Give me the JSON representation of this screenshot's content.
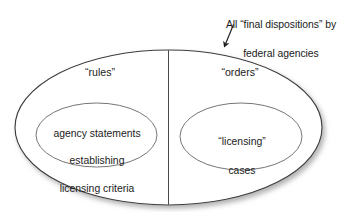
{
  "diagram": {
    "type": "euler-venn",
    "title_callout": {
      "line1": "All “final dispositions” by",
      "line2": "federal agencies",
      "points_to": "outer-ellipse"
    },
    "outer_region": {
      "name": "all-final-dispositions",
      "divided_into": 2
    },
    "left_half": {
      "label": "“rules”",
      "inner": {
        "line1": "agency statements",
        "line2": "establishing",
        "line3": "licensing criteria"
      }
    },
    "right_half": {
      "label": "“orders”",
      "inner": {
        "line1": "“licensing”",
        "line2": "cases"
      }
    },
    "colors": {
      "background": "#ffffff",
      "stroke": "#3c3c3c",
      "inner_stroke": "#6b6b6b",
      "text": "#1b1b1b",
      "shadow": "#b9b9b9"
    }
  }
}
